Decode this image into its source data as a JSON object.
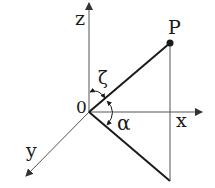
{
  "diagram": {
    "title": "",
    "colors": {
      "axis": "#555555",
      "vector": "#1a1a1a",
      "text": "#1a1a1a",
      "background": "#ffffff"
    },
    "origin_label": "0",
    "axes": {
      "x": {
        "label": "x"
      },
      "y": {
        "label": "y"
      },
      "z": {
        "label": "z"
      }
    },
    "point": {
      "label": "P"
    },
    "angles": {
      "zeta": {
        "label": "ζ",
        "description": "angle between z-axis and OP"
      },
      "alpha": {
        "label": "α",
        "description": "angle between OP and its projection"
      }
    }
  }
}
